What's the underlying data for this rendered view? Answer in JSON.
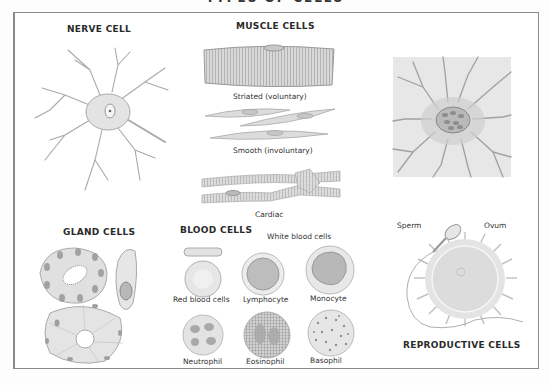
{
  "title": "TYPES OF CELLS",
  "sections": {
    "nerve": {
      "heading": "NERVE CELL"
    },
    "muscle": {
      "heading": "MUSCLE CELLS",
      "labels": [
        "Striated (voluntary)",
        "Smooth (involuntary)",
        "Cardiac"
      ]
    },
    "bone": {
      "heading": "BONE CELL"
    },
    "gland": {
      "heading": "GLAND CELLS"
    },
    "blood": {
      "heading": "BLOOD CELLS",
      "subheading": "White blood cells",
      "labels": [
        "Red blood cells",
        "Lymphocyte",
        "Monocyte",
        "Neutrophil",
        "Eosinophil",
        "Basophil"
      ]
    },
    "reproductive": {
      "heading": "REPRODUCTIVE CELLS",
      "labels": [
        "Sperm",
        "Ovum"
      ]
    }
  },
  "colors": {
    "frame": "#8a8a8a",
    "cell_fill": "#e4e4e4",
    "cell_stroke": "#a8a8a8",
    "nucleus": "#9a9a9a"
  }
}
